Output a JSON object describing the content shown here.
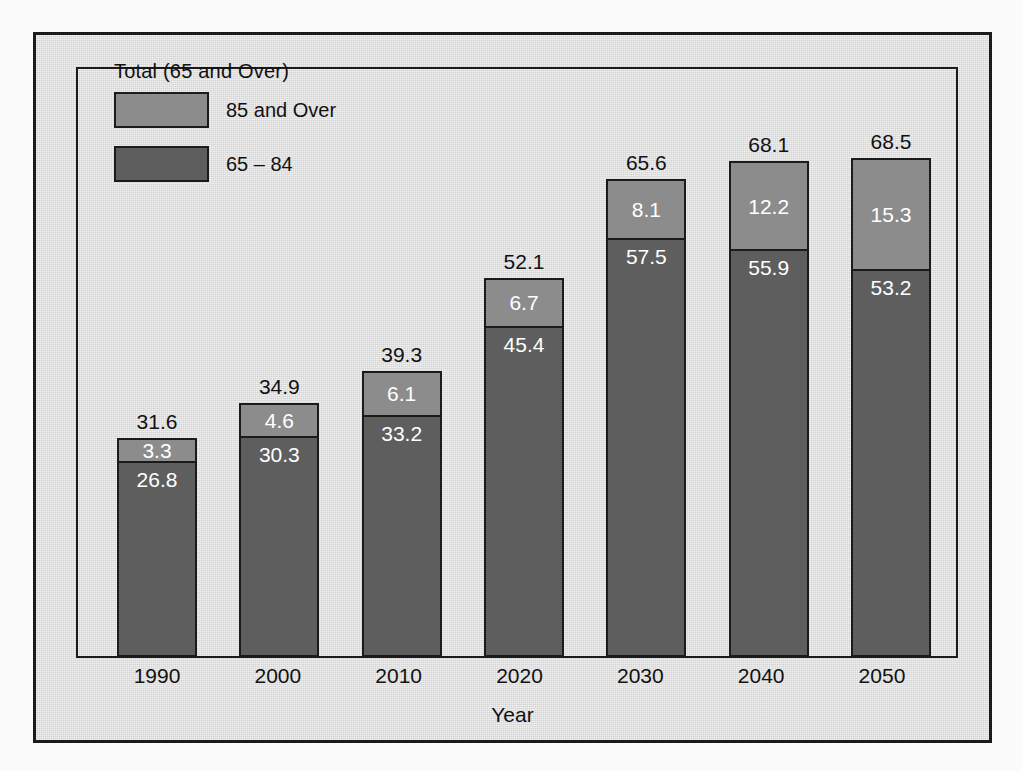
{
  "chart_data": {
    "type": "bar",
    "subtype": "stacked-vertical",
    "title": "",
    "xlabel": "Year",
    "ylabel": "",
    "categories": [
      "1990",
      "2000",
      "2010",
      "2020",
      "2030",
      "2040",
      "2050"
    ],
    "series": [
      {
        "name": "65 – 84",
        "color": "#5e5e5e",
        "values": [
          26.8,
          30.3,
          33.2,
          45.4,
          57.5,
          55.9,
          53.2
        ]
      },
      {
        "name": "85 and Over",
        "color": "#8c8c8c",
        "values": [
          3.3,
          4.6,
          6.1,
          6.7,
          8.1,
          12.2,
          15.3
        ]
      }
    ],
    "totals": [
      31.6,
      34.9,
      39.3,
      52.1,
      65.6,
      68.1,
      68.5
    ],
    "total_label": "Total (65 and Over)",
    "ylim": [
      0,
      68.5
    ],
    "grid": false,
    "legend_position": "top-left",
    "axis_ticks_visible": false
  },
  "legend": {
    "title": "Total (65 and Over)",
    "items": [
      {
        "label": "85 and Over",
        "color": "#8c8c8c",
        "swatch": "light"
      },
      {
        "label": "65 – 84",
        "color": "#5e5e5e",
        "swatch": "dark"
      }
    ]
  },
  "axis": {
    "x_title": "Year",
    "x_labels": [
      "1990",
      "2000",
      "2010",
      "2020",
      "2030",
      "2040",
      "2050"
    ]
  },
  "bars": [
    {
      "year": "1990",
      "total": "31.6",
      "top_value": "3.3",
      "bottom_value": "26.8",
      "total_num": 31.6,
      "top_num": 3.3,
      "bottom_num": 26.8
    },
    {
      "year": "2000",
      "total": "34.9",
      "top_value": "4.6",
      "bottom_value": "30.3",
      "total_num": 34.9,
      "top_num": 4.6,
      "bottom_num": 30.3
    },
    {
      "year": "2010",
      "total": "39.3",
      "top_value": "6.1",
      "bottom_value": "33.2",
      "total_num": 39.3,
      "top_num": 6.1,
      "bottom_num": 33.2
    },
    {
      "year": "2020",
      "total": "52.1",
      "top_value": "6.7",
      "bottom_value": "45.4",
      "total_num": 52.1,
      "top_num": 6.7,
      "bottom_num": 45.4
    },
    {
      "year": "2030",
      "total": "65.6",
      "top_value": "8.1",
      "bottom_value": "57.5",
      "total_num": 65.6,
      "top_num": 8.1,
      "bottom_num": 57.5
    },
    {
      "year": "2040",
      "total": "68.1",
      "top_value": "12.2",
      "bottom_value": "55.9",
      "total_num": 68.1,
      "top_num": 12.2,
      "bottom_num": 55.9
    },
    {
      "year": "2050",
      "total": "68.5",
      "top_value": "15.3",
      "bottom_value": "53.2",
      "total_num": 68.5,
      "top_num": 15.3,
      "bottom_num": 53.2
    }
  ],
  "colors": {
    "background": "#dcdcdc",
    "frame": "#1b1b1b",
    "segment_85_over": "#8c8c8c",
    "segment_65_84": "#5e5e5e",
    "text": "#111111",
    "segment_text": "#ffffff"
  },
  "scale": {
    "pixels_per_unit": 7.28,
    "plot_height_px": 589
  }
}
